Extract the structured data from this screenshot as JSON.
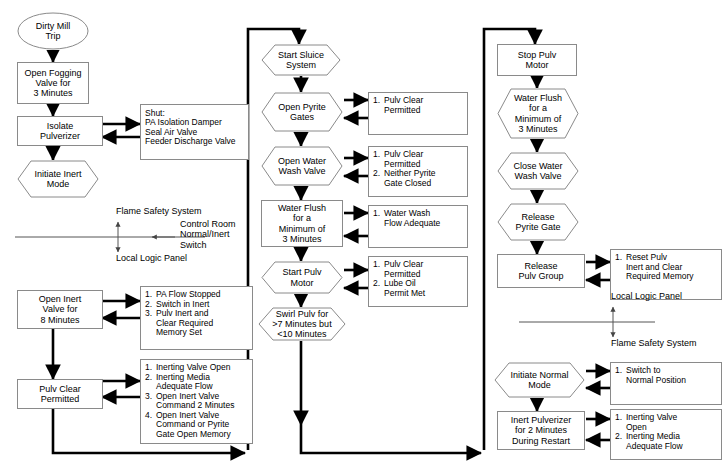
{
  "diagram": {
    "colors": {
      "line": "#000000",
      "shape_border": "#8a8a8a",
      "background": "#ffffff",
      "divider": "#555555"
    }
  },
  "columns": {
    "left": {
      "nodes": {
        "start": {
          "shape": "ellipse",
          "lines": [
            "Dirty Mill",
            "Trip"
          ]
        },
        "open_fogging_valve": {
          "shape": "rectangle",
          "lines": [
            "Open Fogging",
            "Valve for",
            "3 Minutes"
          ]
        },
        "isolate_pulverizer": {
          "shape": "rectangle",
          "lines": [
            "Isolate",
            "Pulverizer"
          ]
        },
        "shut_list": {
          "shape": "listbox",
          "header": "Shut:",
          "items": [
            "PA Isolation Damper",
            "Seal Air Valve",
            "Feeder Discharge Valve"
          ]
        },
        "initiate_inert_mode": {
          "shape": "hexagon",
          "lines": [
            "Initiate Inert",
            "Mode"
          ]
        },
        "open_inert_valve": {
          "shape": "rectangle",
          "lines": [
            "Open Inert",
            "Valve for",
            "8 Minutes"
          ]
        },
        "open_inert_valve_conditions": {
          "shape": "listbox",
          "items": [
            {
              "n": "1.",
              "lines": [
                "PA Flow Stopped"
              ]
            },
            {
              "n": "2.",
              "lines": [
                "Switch in Inert"
              ]
            },
            {
              "n": "3.",
              "lines": [
                "Pulv Inert and",
                "Clear Required",
                "Memory Set"
              ]
            }
          ]
        },
        "pulv_clear_permitted": {
          "shape": "rectangle",
          "lines": [
            "Pulv Clear",
            "Permitted"
          ]
        },
        "pulv_clear_conditions": {
          "shape": "listbox",
          "items": [
            {
              "n": "1.",
              "lines": [
                "Inerting Valve Open"
              ]
            },
            {
              "n": "2.",
              "lines": [
                "Inerting Media",
                "Adequate Flow"
              ]
            },
            {
              "n": "3.",
              "lines": [
                "Open Inert Valve",
                "Command 2 Minutes"
              ]
            },
            {
              "n": "4.",
              "lines": [
                "Open Inert Valve",
                "Command or Pyrite",
                "Gate Open Memory"
              ]
            }
          ]
        }
      },
      "divider": {
        "above_label": "Flame Safety System",
        "below_label": "Local Logic Panel",
        "side_label": [
          "Control Room",
          "Normal/Inert",
          "Switch"
        ]
      }
    },
    "middle": {
      "nodes": {
        "start_sluice_system": {
          "shape": "hexagon",
          "lines": [
            "Start Sluice",
            "System"
          ]
        },
        "open_pyrite_gates": {
          "shape": "hexagon",
          "lines": [
            "Open Pyrite",
            "Gates"
          ]
        },
        "open_pyrite_gates_conditions": {
          "shape": "listbox",
          "items": [
            {
              "n": "1.",
              "lines": [
                "Pulv Clear",
                "Permitted"
              ]
            }
          ]
        },
        "open_water_wash_valve": {
          "shape": "hexagon",
          "lines": [
            "Open Water",
            "Wash Valve"
          ]
        },
        "open_water_wash_valve_conditions": {
          "shape": "listbox",
          "items": [
            {
              "n": "1.",
              "lines": [
                "Pulv Clear",
                "Permitted"
              ]
            },
            {
              "n": "2.",
              "lines": [
                "Neither Pyrite",
                "Gate Closed"
              ]
            }
          ]
        },
        "water_flush": {
          "shape": "rectangle",
          "lines": [
            "Water Flush",
            "for a",
            "Minimum of",
            "3 Minutes"
          ]
        },
        "water_flush_conditions": {
          "shape": "listbox",
          "items": [
            {
              "n": "1.",
              "lines": [
                "Water Wash",
                "Flow Adequate"
              ]
            }
          ]
        },
        "start_pulv_motor": {
          "shape": "hexagon",
          "lines": [
            "Start Pulv",
            "Motor"
          ]
        },
        "start_pulv_motor_conditions": {
          "shape": "listbox",
          "items": [
            {
              "n": "1.",
              "lines": [
                "Pulv Clear",
                "Permitted"
              ]
            },
            {
              "n": "2.",
              "lines": [
                "Lube Oil",
                "Permit Met"
              ]
            }
          ]
        },
        "swirl_pulv": {
          "shape": "hexagon",
          "lines": [
            "Swirl Pulv for",
            ">7 Minutes but",
            "<10 Minutes"
          ]
        }
      }
    },
    "right": {
      "nodes": {
        "stop_pulv_motor": {
          "shape": "rectangle",
          "lines": [
            "Stop Pulv",
            "Motor"
          ]
        },
        "water_flush": {
          "shape": "hexagon",
          "lines": [
            "Water Flush",
            "for a",
            "Minimum of",
            "3 Minutes"
          ]
        },
        "close_water_wash_valve": {
          "shape": "hexagon",
          "lines": [
            "Close Water",
            "Wash Valve"
          ]
        },
        "release_pyrite_gate": {
          "shape": "hexagon",
          "lines": [
            "Release",
            "Pyrite Gate"
          ]
        },
        "release_pulv_group": {
          "shape": "rectangle",
          "lines": [
            "Release",
            "Pulv Group"
          ]
        },
        "release_pulv_group_conditions": {
          "shape": "listbox",
          "items": [
            {
              "n": "1.",
              "lines": [
                "Reset Pulv",
                "Inert and Clear",
                "Required Memory"
              ]
            }
          ]
        },
        "initiate_normal_mode": {
          "shape": "hexagon",
          "lines": [
            "Initiate Normal",
            "Mode"
          ]
        },
        "initiate_normal_mode_conditions": {
          "shape": "listbox",
          "items": [
            {
              "n": "1.",
              "lines": [
                "Switch to",
                "Normal Position"
              ]
            }
          ]
        },
        "inert_pulverizer": {
          "shape": "rectangle",
          "lines": [
            "Inert Pulverizer",
            "for 2 Minutes",
            "During Restart"
          ]
        },
        "inert_pulverizer_conditions": {
          "shape": "listbox",
          "items": [
            {
              "n": "1.",
              "lines": [
                "Inerting Valve",
                "Open"
              ]
            },
            {
              "n": "2.",
              "lines": [
                "Inerting Media",
                "Adequate Flow"
              ]
            }
          ]
        }
      },
      "divider": {
        "above_label": "Local Logic Panel",
        "below_label": "Flame Safety System"
      }
    }
  }
}
